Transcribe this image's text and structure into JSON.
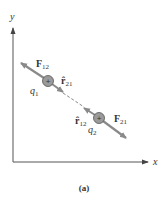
{
  "axes": {
    "x_label": "x",
    "y_label": "y"
  },
  "charges": [
    {
      "id": "q1",
      "name": "q",
      "sub": "1",
      "sign": "+"
    },
    {
      "id": "q2",
      "name": "q",
      "sub": "2",
      "sign": "+"
    }
  ],
  "forces": {
    "f12": {
      "name": "F",
      "sub": "12"
    },
    "f21": {
      "name": "F",
      "sub": "21"
    }
  },
  "unit_vectors": {
    "r21": {
      "name": "r̂",
      "sub": "21"
    },
    "r12": {
      "name": "r̂",
      "sub": "12"
    }
  },
  "caption": "(a)",
  "colors": {
    "arrow": "#8a8a8a",
    "charge_fill": "#9a9a9a",
    "axis": "#555555",
    "text": "#333333"
  }
}
